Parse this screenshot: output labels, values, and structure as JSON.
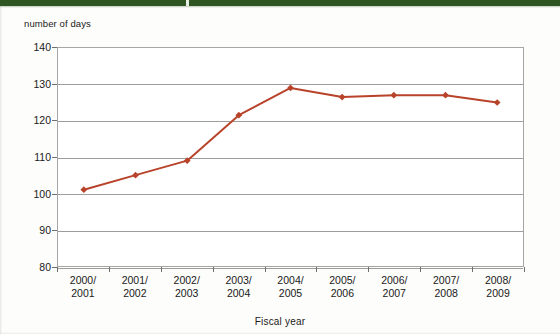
{
  "banner": {
    "color": "#2f5622"
  },
  "chart_data": {
    "type": "line",
    "title": "",
    "ylabel": "number of days",
    "xlabel": "Fiscal year",
    "categories": [
      "2000/\n2001",
      "2001/\n2002",
      "2002/\n2003",
      "2003/\n2004",
      "2004/\n2005",
      "2005/\n2006",
      "2006/\n2007",
      "2007/\n2008",
      "2008/\n2009"
    ],
    "category_lines": [
      [
        "2000/",
        "2001"
      ],
      [
        "2001/",
        "2002"
      ],
      [
        "2002/",
        "2003"
      ],
      [
        "2003/",
        "2004"
      ],
      [
        "2004/",
        "2005"
      ],
      [
        "2005/",
        "2006"
      ],
      [
        "2006/",
        "2007"
      ],
      [
        "2007/",
        "2008"
      ],
      [
        "2008/",
        "2009"
      ]
    ],
    "values": [
      101,
      105,
      109,
      121.5,
      129,
      126.5,
      127,
      127,
      125
    ],
    "ylim": [
      80,
      140
    ],
    "yticks": [
      80,
      90,
      100,
      110,
      120,
      130,
      140
    ],
    "ytick_labels": [
      "80",
      "90",
      "100",
      "110",
      "120",
      "130",
      "140"
    ],
    "grid": true,
    "legend": "none",
    "series_color": "#b8432a",
    "marker": "diamond",
    "gridline_color": "#9d9d9d",
    "axis_color": "#a6a6a6"
  }
}
